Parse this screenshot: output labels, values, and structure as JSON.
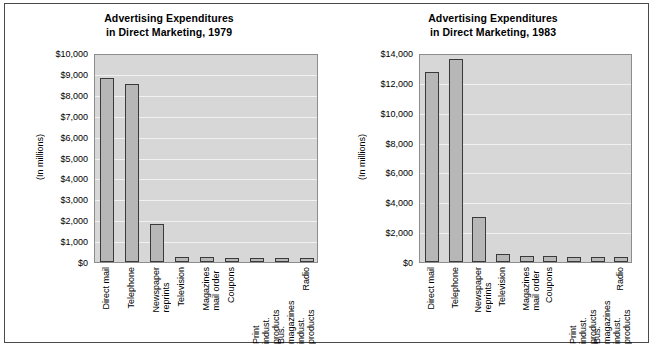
{
  "figure": {
    "background_color": "#ffffff",
    "border_color": "#4a4a4a",
    "plot_background_color": "#d7d7d7",
    "bar_fill_color": "#b7b7b7",
    "bar_edge_color": "#3a3a3a",
    "gridline_color": "#f1f1f1"
  },
  "charts": [
    {
      "id": "chart-1979",
      "title": "Advertising Expenditures\nin Direct Marketing, 1979",
      "ylabel": "(In millions)",
      "ytick_labels": [
        "$10,000",
        "$9,000",
        "$8,000",
        "$7,000",
        "$6,000",
        "$5,000",
        "$4,000",
        "$3,000",
        "$2,000",
        "$1,000",
        "$0"
      ],
      "categories": [
        "Direct mail",
        "Telephone",
        "Newspaper\nreprints",
        "Television",
        "Magazines\nmail order",
        "Coupons",
        "Print\nindust. products",
        "Bus. magazines\nindust. products",
        "Radio"
      ],
      "values": [
        8800,
        8500,
        1800,
        250,
        230,
        200,
        200,
        195,
        200
      ]
    },
    {
      "id": "chart-1983",
      "title": "Advertising Expenditures\nin Direct Marketing, 1983",
      "ylabel": "(In millions)",
      "ytick_labels": [
        "$14,000",
        "$12,000",
        "$10,000",
        "$8,000",
        "$6,000",
        "$4,000",
        "$2,000",
        "$0"
      ],
      "categories": [
        "Direct mail",
        "Telephone",
        "Newspaper\nreprints",
        "Television",
        "Magazines\nmail order",
        "Coupons",
        "Print\nindust. products",
        "Bus. magazines\nindust. products",
        "Radio"
      ],
      "values": [
        12750,
        13600,
        3000,
        520,
        380,
        380,
        350,
        330,
        310
      ]
    }
  ],
  "chart_data": [
    {
      "type": "bar",
      "title": "Advertising Expenditures in Direct Marketing, 1979",
      "xlabel": "",
      "ylabel": "(In millions)",
      "ylim": [
        0,
        10000
      ],
      "ytick_values": [
        0,
        1000,
        2000,
        3000,
        4000,
        5000,
        6000,
        7000,
        8000,
        9000,
        10000
      ],
      "ytick_labels": [
        "$0",
        "$1,000",
        "$2,000",
        "$3,000",
        "$4,000",
        "$5,000",
        "$6,000",
        "$7,000",
        "$8,000",
        "$9,000",
        "$10,000"
      ],
      "grid": true,
      "legend": "none",
      "categories": [
        "Direct mail",
        "Telephone",
        "Newspaper reprints",
        "Television",
        "Magazines mail order",
        "Coupons",
        "Print indust. products",
        "Bus. magazines indust. products",
        "Radio"
      ],
      "values": [
        8800,
        8500,
        1800,
        250,
        230,
        200,
        200,
        195,
        200
      ]
    },
    {
      "type": "bar",
      "title": "Advertising Expenditures in Direct Marketing, 1983",
      "xlabel": "",
      "ylabel": "(In millions)",
      "ylim": [
        0,
        14000
      ],
      "ytick_values": [
        0,
        2000,
        4000,
        6000,
        8000,
        10000,
        12000,
        14000
      ],
      "ytick_labels": [
        "$0",
        "$2,000",
        "$4,000",
        "$6,000",
        "$8,000",
        "$10,000",
        "$12,000",
        "$14,000"
      ],
      "grid": true,
      "legend": "none",
      "categories": [
        "Direct mail",
        "Telephone",
        "Newspaper reprints",
        "Television",
        "Magazines mail order",
        "Coupons",
        "Print indust. products",
        "Bus. magazines indust. products",
        "Radio"
      ],
      "values": [
        12750,
        13600,
        3000,
        520,
        380,
        380,
        350,
        330,
        310
      ]
    }
  ]
}
